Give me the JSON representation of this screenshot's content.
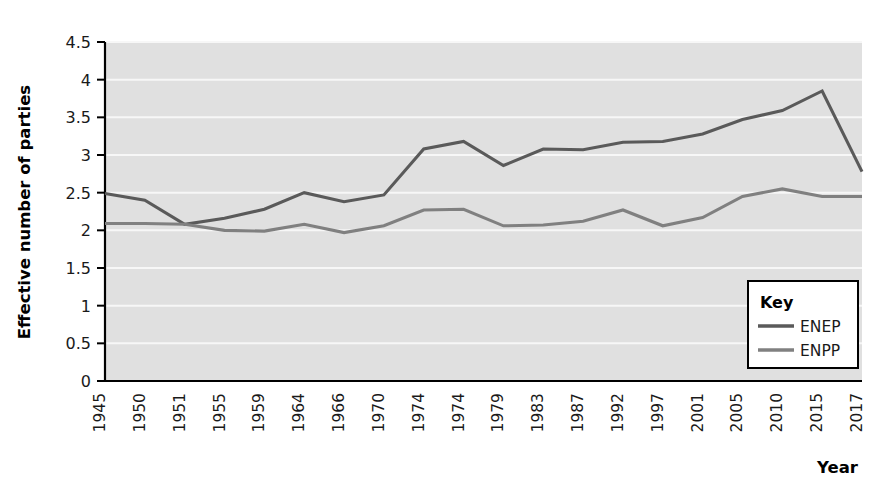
{
  "chart_data": {
    "type": "line",
    "title": "",
    "xlabel": "Year",
    "ylabel": "Effective number of parties",
    "categories": [
      "1945",
      "1950",
      "1951",
      "1955",
      "1959",
      "1964",
      "1966",
      "1970",
      "1974",
      "1974",
      "1979",
      "1983",
      "1987",
      "1992",
      "1997",
      "2001",
      "2005",
      "2010",
      "2015",
      "2017"
    ],
    "x_tick_labels": [
      "1945",
      "1950",
      "1951",
      "1955",
      "1959",
      "1964",
      "1966",
      "1970",
      "1974",
      "1974",
      "1979",
      "1983",
      "1987",
      "1992",
      "1997",
      "2001",
      "2005",
      "2010",
      "2015",
      "2017"
    ],
    "y_tick_labels": [
      "0",
      "0.5",
      "1",
      "1.5",
      "2",
      "2.5",
      "3",
      "3.5",
      "4",
      "4.5"
    ],
    "y_ticks": [
      0,
      0.5,
      1,
      1.5,
      2,
      2.5,
      3,
      3.5,
      4,
      4.5
    ],
    "ylim": [
      0,
      4.5
    ],
    "grid": "horizontal",
    "legend_position": "bottom-right",
    "legend_title": "Key",
    "series": [
      {
        "name": "ENEP",
        "color": "#5a5a5a",
        "values": [
          2.49,
          2.4,
          2.08,
          2.16,
          2.28,
          2.5,
          2.38,
          2.47,
          3.08,
          3.18,
          2.86,
          3.08,
          3.07,
          3.17,
          3.18,
          3.28,
          3.47,
          3.59,
          3.85,
          2.78
        ]
      },
      {
        "name": "ENPP",
        "color": "#808080",
        "values": [
          2.09,
          2.09,
          2.08,
          2.0,
          1.99,
          2.08,
          1.97,
          2.06,
          2.27,
          2.28,
          2.06,
          2.07,
          2.12,
          2.27,
          2.06,
          2.17,
          2.45,
          2.55,
          2.45,
          2.45
        ]
      }
    ]
  },
  "legend": {
    "title": "Key",
    "entries": [
      {
        "label": "ENEP",
        "color": "#5a5a5a"
      },
      {
        "label": "ENPP",
        "color": "#808080"
      }
    ]
  },
  "axes": {
    "y_title": "Effective number of parties",
    "x_title": "Year"
  },
  "style": {
    "plot_background": "#e0e0e0",
    "gridline_color": "#f7f7f7",
    "axis_color": "#000000",
    "page_background": "#ffffff"
  }
}
